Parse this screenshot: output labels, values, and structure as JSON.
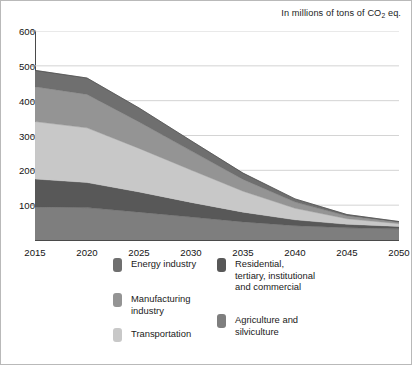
{
  "caption": {
    "prefix": "In millions of tons of CO",
    "subscript": "2",
    "suffix": " eq."
  },
  "axes": {
    "y_ticks": [
      600,
      500,
      400,
      300,
      200,
      100
    ],
    "x_ticks": [
      2015,
      2020,
      2025,
      2030,
      2035,
      2040,
      2045,
      2050
    ]
  },
  "legend": {
    "items": [
      {
        "label": "Energy industry",
        "color": "#6f6f6f",
        "column": "a",
        "row": 0
      },
      {
        "label": "Manufacturing\nindustry",
        "color": "#949494",
        "column": "a",
        "row": 1
      },
      {
        "label": "Transportation",
        "color": "#c8c8c8",
        "column": "a",
        "row": 2
      },
      {
        "label": "Residential,\ntertiary, institutional\nand commercial",
        "color": "#585858",
        "column": "b",
        "row": 0
      },
      {
        "label": "Agriculture and\nsilviculture",
        "color": "#7e7e7e",
        "column": "b",
        "row": 1
      }
    ]
  },
  "chart_data": {
    "type": "area",
    "stacked": true,
    "title": "",
    "subtitle": "In millions of tons of CO2 eq.",
    "xlabel": "",
    "ylabel": "",
    "xlim": [
      2015,
      2050
    ],
    "ylim": [
      0,
      600
    ],
    "grid": true,
    "grid_axis": "y",
    "legend_position": "bottom",
    "x": [
      2015,
      2020,
      2025,
      2030,
      2035,
      2040,
      2045,
      2050
    ],
    "series": [
      {
        "name": "Agriculture and silviculture",
        "color": "#7e7e7e",
        "values": [
          95,
          93,
          80,
          66,
          52,
          41,
          35,
          32
        ]
      },
      {
        "name": "Residential, tertiary, institutional and commercial",
        "color": "#585858",
        "values": [
          80,
          72,
          58,
          42,
          28,
          17,
          10,
          7
        ]
      },
      {
        "name": "Transportation",
        "color": "#c8c8c8",
        "values": [
          165,
          157,
          125,
          93,
          60,
          33,
          16,
          8
        ]
      },
      {
        "name": "Manufacturing industry",
        "color": "#949494",
        "values": [
          100,
          96,
          76,
          55,
          34,
          18,
          8,
          4
        ]
      },
      {
        "name": "Energy industry",
        "color": "#6f6f6f",
        "values": [
          47,
          47,
          40,
          29,
          18,
          9,
          4,
          2
        ]
      }
    ],
    "totals": [
      487,
      465,
      379,
      285,
      192,
      118,
      73,
      53
    ]
  }
}
